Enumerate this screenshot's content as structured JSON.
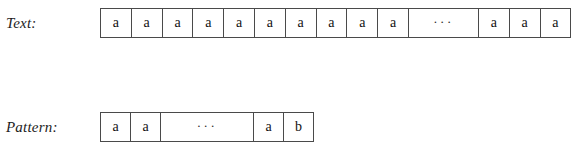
{
  "figure": {
    "caption": "",
    "colors": {
      "cell_border": "#4a4a4a",
      "cell_background": "#ffffff",
      "glyph": "#111111",
      "page_background": "#ffffff"
    }
  },
  "rows": [
    {
      "id": "text",
      "label": "Text:",
      "cells": [
        {
          "value": "a",
          "kind": "symbol"
        },
        {
          "value": "a",
          "kind": "symbol"
        },
        {
          "value": "a",
          "kind": "symbol"
        },
        {
          "value": "a",
          "kind": "symbol"
        },
        {
          "value": "a",
          "kind": "symbol"
        },
        {
          "value": "a",
          "kind": "symbol"
        },
        {
          "value": "a",
          "kind": "symbol"
        },
        {
          "value": "a",
          "kind": "symbol"
        },
        {
          "value": "a",
          "kind": "symbol"
        },
        {
          "value": "a",
          "kind": "symbol"
        },
        {
          "value": "···",
          "kind": "ellipsis"
        },
        {
          "value": "a",
          "kind": "symbol"
        },
        {
          "value": "a",
          "kind": "symbol"
        },
        {
          "value": "a",
          "kind": "symbol"
        }
      ]
    },
    {
      "id": "pattern",
      "label": "Pattern:",
      "cells": [
        {
          "value": "a",
          "kind": "symbol"
        },
        {
          "value": "a",
          "kind": "symbol"
        },
        {
          "value": "···",
          "kind": "ellipsis"
        },
        {
          "value": "a",
          "kind": "symbol"
        },
        {
          "value": "b",
          "kind": "symbol"
        }
      ]
    }
  ]
}
